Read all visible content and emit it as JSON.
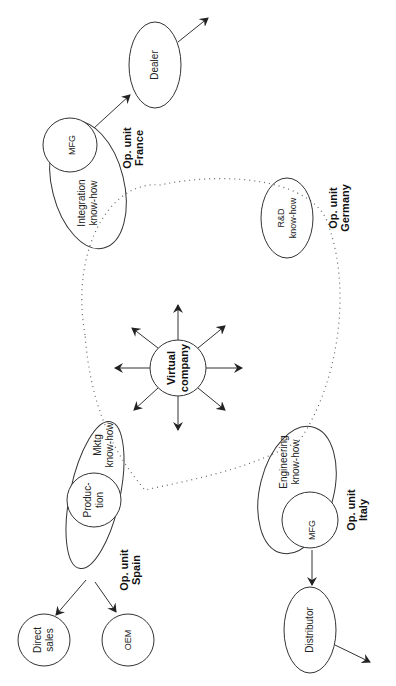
{
  "diagram": {
    "center": {
      "line1": "Virtual",
      "line2": "company"
    },
    "units": {
      "spain": {
        "title1": "Op. unit",
        "title2": "Spain",
        "outer1": "Mktg",
        "outer2": "know-how",
        "inner1": "Produc-",
        "inner2": "tion",
        "out_a1": "Direct",
        "out_a2": "sales",
        "out_b": "OEM"
      },
      "france": {
        "title1": "Op. unit",
        "title2": "France",
        "outer1": "Integration",
        "outer2": "know-how",
        "inner": "MFG",
        "out": "Dealer"
      },
      "germany": {
        "title1": "Op. unit",
        "title2": "Germany",
        "outer1": "R&D",
        "outer2": "know-how"
      },
      "italy": {
        "title1": "Op. unit",
        "title2": "Italy",
        "outer1": "Engineering",
        "outer2": "know-how",
        "inner": "MFG",
        "out": "Distributor"
      }
    },
    "colors": {
      "line": "#333333",
      "dotted": "#666666",
      "background": "#ffffff"
    }
  }
}
